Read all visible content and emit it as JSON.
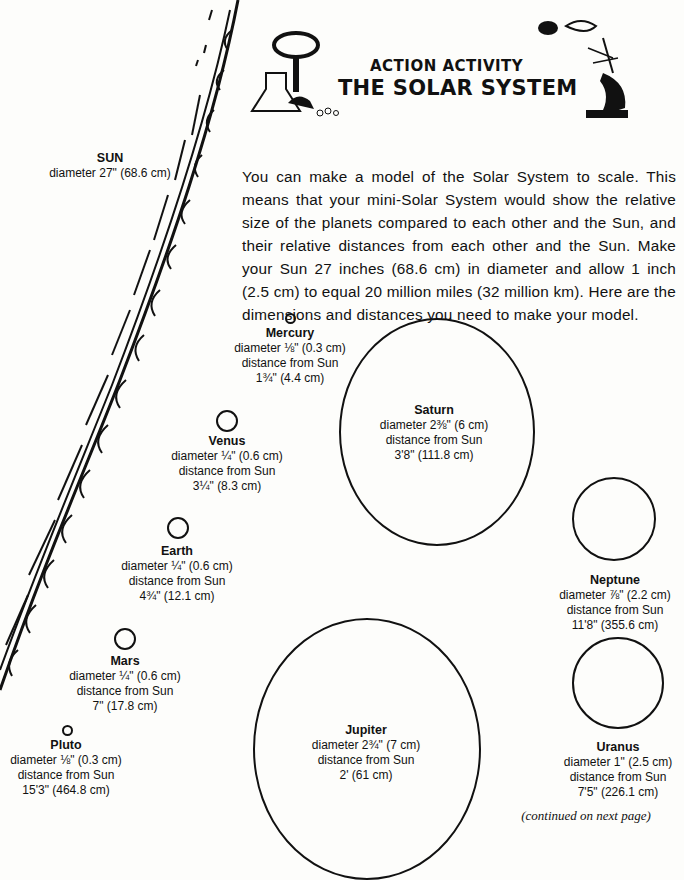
{
  "header": {
    "kicker": "ACTION ACTIVITY",
    "title": "THE SOLAR SYSTEM"
  },
  "intro": "You can make a model of the Solar System to scale. This means that your mini-Solar System would show the relative size of the planets compared to each other and the Sun, and their relative distances from each other and the Sun. Make your Sun 27 inches (68.6 cm) in diameter and allow 1 inch (2.5 cm) to equal 20 million miles (32 million km). Here are the dimensions and distances you need to make your model.",
  "sun": {
    "name": "SUN",
    "diameter": "diameter  27\" (68.6 cm)"
  },
  "planets": {
    "mercury": {
      "name": "Mercury",
      "diameter": "diameter  ⅛\" (0.3 cm)",
      "dist_label": "distance from Sun",
      "distance": "1¾\" (4.4 cm)"
    },
    "venus": {
      "name": "Venus",
      "diameter": "diameter  ¼\" (0.6 cm)",
      "dist_label": "distance from Sun",
      "distance": "3¼\" (8.3 cm)"
    },
    "earth": {
      "name": "Earth",
      "diameter": "diameter  ¼\" (0.6 cm)",
      "dist_label": "distance from Sun",
      "distance": "4¾\" (12.1 cm)"
    },
    "mars": {
      "name": "Mars",
      "diameter": "diameter  ¼\" (0.6 cm)",
      "dist_label": "distance from Sun",
      "distance": "7\" (17.8 cm)"
    },
    "pluto": {
      "name": "Pluto",
      "diameter": "diameter  ⅛\" (0.3 cm)",
      "dist_label": "distance from Sun",
      "distance": "15'3\" (464.8 cm)"
    },
    "saturn": {
      "name": "Saturn",
      "diameter": "diameter  2⅜\" (6 cm)",
      "dist_label": "distance from Sun",
      "distance": "3'8\" (111.8 cm)"
    },
    "jupiter": {
      "name": "Jupiter",
      "diameter": "diameter  2¾\" (7 cm)",
      "dist_label": "distance from Sun",
      "distance": "2' (61 cm)"
    },
    "neptune": {
      "name": "Neptune",
      "diameter": "diameter  ⅞\" (2.2 cm)",
      "dist_label": "distance from Sun",
      "distance": "11'8\" (355.6 cm)"
    },
    "uranus": {
      "name": "Uranus",
      "diameter": "diameter  1\" (2.5 cm)",
      "dist_label": "distance from Sun",
      "distance": "7'5\" (226.1 cm)"
    }
  },
  "footer": {
    "continued": "(continued on next page)"
  }
}
